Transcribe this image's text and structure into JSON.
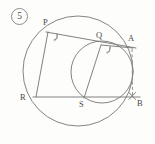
{
  "figure": {
    "item_number": "5",
    "item_number_style": "circled",
    "background_color": "#fdfdfc",
    "stroke_color": "#8a8a8a",
    "label_color": "#4a4a4a",
    "width": 155,
    "height": 144,
    "points": [
      {
        "id": "P",
        "label": "P",
        "x": 48,
        "y": 32,
        "label_x": 43,
        "label_y": 21
      },
      {
        "id": "Q",
        "label": "Q",
        "x": 101,
        "y": 45,
        "label_x": 97,
        "label_y": 34
      },
      {
        "id": "A",
        "label": "A",
        "x": 133,
        "y": 48,
        "label_x": 128,
        "label_y": 37
      },
      {
        "id": "R",
        "label": "R",
        "x": 36,
        "y": 97,
        "label_x": 21,
        "label_y": 95
      },
      {
        "id": "S",
        "label": "S",
        "x": 84,
        "y": 98,
        "label_x": 80,
        "label_y": 102
      },
      {
        "id": "B",
        "label": "B",
        "x": 133,
        "y": 97,
        "label_x": 136,
        "label_y": 100
      }
    ],
    "circles": [
      {
        "id": "large-circle",
        "cx": 78,
        "cy": 71,
        "r": 55
      },
      {
        "id": "small-circle",
        "cx": 102,
        "cy": 72,
        "r": 31
      }
    ],
    "segments": [
      {
        "id": "chord-RB",
        "from": "R",
        "to": "B",
        "style": "solid"
      },
      {
        "id": "chord-PA",
        "from": "P",
        "to": "A",
        "style": "solid"
      },
      {
        "id": "chord-PR",
        "from": "P",
        "to": "R",
        "style": "solid"
      },
      {
        "id": "chord-QS",
        "from": "Q",
        "to": "S",
        "style": "solid"
      },
      {
        "id": "chord-QA",
        "from": "Q",
        "to": "A",
        "style": "solid"
      },
      {
        "id": "segment-AB",
        "from": "A",
        "to": "B",
        "style": "dashed"
      }
    ],
    "angle_marks": [
      {
        "id": "right-angle-P",
        "at": "P",
        "type": "right-angle"
      },
      {
        "id": "right-angle-Q",
        "at": "Q",
        "type": "right-angle"
      }
    ],
    "point_marks": [
      {
        "id": "cross-mark-B",
        "at": "B",
        "type": "cross"
      }
    ]
  }
}
